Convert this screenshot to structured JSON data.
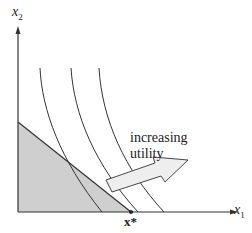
{
  "diagram": {
    "axes": {
      "x_label": "x",
      "x_subscript": "1",
      "y_label": "x",
      "y_subscript": "2"
    },
    "annotation": {
      "line1": "increasing",
      "line2": "utility"
    },
    "optimum_label": "x*",
    "colors": {
      "shade": "#cfcfcf",
      "shade_light": "#e4e4e4",
      "line": "#333333",
      "arrow_fill": "#eeeeee"
    },
    "elements": [
      "x1 axis",
      "x2 axis",
      "budget set (shaded triangle)",
      "three indifference curves",
      "increasing utility arrow",
      "corner solution x*"
    ]
  }
}
